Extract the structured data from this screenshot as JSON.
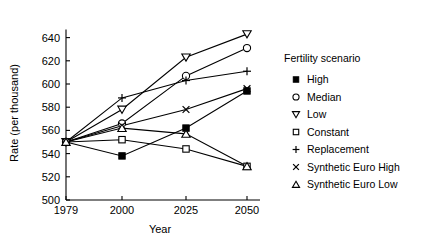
{
  "chart_data": {
    "type": "line",
    "title": "",
    "xlabel": "Year",
    "ylabel": "Rate (per thousand)",
    "categories": [
      "1979",
      "2000",
      "2025",
      "2050"
    ],
    "x": [
      1979,
      2000,
      2025,
      2050
    ],
    "ylim": [
      500,
      650
    ],
    "yticks": [
      500,
      520,
      540,
      560,
      580,
      600,
      620,
      640
    ],
    "ytick_labels": [
      "500",
      "520",
      "540",
      "560",
      "580",
      "600",
      "620",
      "640"
    ],
    "xtick_labels": [
      "1979",
      "2000",
      "2025",
      "2050"
    ],
    "grid": false,
    "legend_position": "right",
    "legend_title": "Fertility scenario",
    "series": [
      {
        "name": "High",
        "marker": "filled-square",
        "values": [
          550,
          538,
          562,
          594
        ]
      },
      {
        "name": "Median",
        "marker": "open-circle",
        "values": [
          550,
          566,
          607,
          631
        ]
      },
      {
        "name": "Low",
        "marker": "open-down-triangle",
        "values": [
          550,
          578,
          623,
          643
        ]
      },
      {
        "name": "Constant",
        "marker": "open-square",
        "values": [
          550,
          552,
          544,
          529
        ]
      },
      {
        "name": "Replacement",
        "marker": "plus",
        "values": [
          550,
          588,
          603,
          611
        ]
      },
      {
        "name": "Synthetic Euro High",
        "marker": "cross",
        "values": [
          550,
          564,
          578,
          596
        ]
      },
      {
        "name": "Synthetic Euro Low",
        "marker": "open-up-triangle",
        "values": [
          550,
          562,
          557,
          529
        ]
      }
    ]
  },
  "legend": {
    "title": "Fertility scenario",
    "items": [
      {
        "label": "High",
        "marker": "filled-square"
      },
      {
        "label": "Median",
        "marker": "open-circle"
      },
      {
        "label": "Low",
        "marker": "open-down-triangle"
      },
      {
        "label": "Constant",
        "marker": "open-square"
      },
      {
        "label": "Replacement",
        "marker": "plus"
      },
      {
        "label": "Synthetic Euro High",
        "marker": "cross"
      },
      {
        "label": "Synthetic Euro Low",
        "marker": "open-up-triangle"
      }
    ]
  },
  "axes": {
    "x_title": "Year",
    "y_title": "Rate (per thousand)"
  },
  "colors": {
    "ink": "#000000",
    "background": "#ffffff"
  }
}
